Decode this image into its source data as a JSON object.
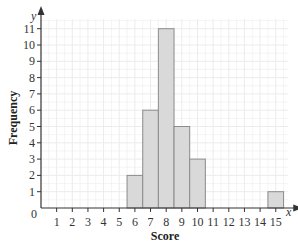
{
  "chart_data": {
    "type": "bar",
    "subtype": "histogram",
    "title": "",
    "xlabel": "Score",
    "ylabel": "Frequency",
    "x_axis_var": "x",
    "y_axis_var": "y",
    "origin_label": "0",
    "categories": [
      6,
      7,
      8,
      9,
      10,
      15
    ],
    "values": [
      2,
      6,
      11,
      5,
      3,
      1
    ],
    "bins": [
      {
        "score": 6,
        "from": 5.5,
        "to": 6.5,
        "frequency": 2
      },
      {
        "score": 7,
        "from": 6.5,
        "to": 7.5,
        "frequency": 6
      },
      {
        "score": 8,
        "from": 7.5,
        "to": 8.5,
        "frequency": 11
      },
      {
        "score": 9,
        "from": 8.5,
        "to": 9.5,
        "frequency": 5
      },
      {
        "score": 10,
        "from": 9.5,
        "to": 10.5,
        "frequency": 3
      },
      {
        "score": 15,
        "from": 14.5,
        "to": 15.5,
        "frequency": 1
      }
    ],
    "xticks": [
      1,
      2,
      3,
      4,
      5,
      6,
      7,
      8,
      9,
      10,
      11,
      12,
      13,
      14,
      15
    ],
    "yticks": [
      1,
      2,
      3,
      4,
      5,
      6,
      7,
      8,
      9,
      10,
      11
    ],
    "xlim": [
      0,
      15.8
    ],
    "ylim": [
      0,
      11.6
    ],
    "grid": true,
    "legend": null,
    "colors": {
      "bar_fill": "#d9d9d9",
      "bar_edge": "#8c8c8c",
      "grid": "#ececec",
      "axis": "#333333"
    }
  }
}
